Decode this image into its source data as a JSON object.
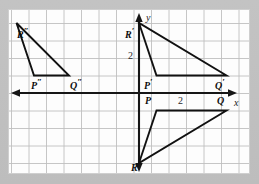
{
  "figure": {
    "kind": "coordinate-plane-geometry-figure",
    "background_color": "#bdbdbd",
    "plane_color": "#fdfdfd",
    "grid_color": "#bcbcbc",
    "axis_color": "#1a1a1a",
    "shape_color": "#111111"
  },
  "axes": {
    "x_label": "x",
    "y_label": "y",
    "y_tick_label": "2",
    "origin_px": {
      "x": 139,
      "y": 93
    },
    "cell_px": 17.5,
    "x_range": [
      -7.4,
      6.3
    ],
    "y_range": [
      -5.1,
      4.7
    ],
    "grid": true,
    "arrows": [
      "left",
      "right",
      "up",
      "down"
    ]
  },
  "measures": {
    "vertical_segment_label": "2",
    "horizontal_segment_label": "2"
  },
  "triangles": [
    {
      "name": "PQR",
      "vertices": [
        {
          "label": "P",
          "x": 1,
          "y": -1
        },
        {
          "label": "Q",
          "x": 5,
          "y": -1
        },
        {
          "label": "R",
          "x": 0,
          "y": -4
        }
      ]
    },
    {
      "name": "P'Q'R'",
      "vertices": [
        {
          "label": "P'",
          "x": 1,
          "y": 1
        },
        {
          "label": "Q'",
          "x": 5,
          "y": 1
        },
        {
          "label": "R'",
          "x": 0,
          "y": 4
        }
      ]
    },
    {
      "name": "P''Q''R''",
      "vertices": [
        {
          "label": "P''",
          "x": -6,
          "y": 1
        },
        {
          "label": "Q''",
          "x": -2,
          "y": 1
        },
        {
          "label": "R''",
          "x": -7,
          "y": 4
        }
      ]
    }
  ],
  "labels": {
    "P": "P",
    "Q": "Q",
    "R": "R",
    "P_prime": "P",
    "Q_prime": "Q",
    "R_prime": "R",
    "P_dprime": "P",
    "Q_dprime": "Q",
    "R_dprime": "R",
    "prime_mark": "′",
    "double_prime_mark": "″"
  }
}
